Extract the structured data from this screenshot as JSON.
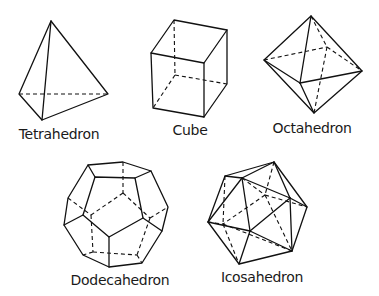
{
  "diagram": {
    "solids": [
      {
        "name": "Tetrahedron",
        "label_pos": [
          59,
          126
        ]
      },
      {
        "name": "Cube",
        "label_pos": [
          190,
          122
        ]
      },
      {
        "name": "Octahedron",
        "label_pos": [
          312,
          120
        ]
      },
      {
        "name": "Dodecahedron",
        "label_pos": [
          120,
          272
        ]
      },
      {
        "name": "Icosahedron",
        "label_pos": [
          262,
          269
        ]
      }
    ],
    "colors": {
      "line": "#111111",
      "background": "#ffffff"
    }
  }
}
